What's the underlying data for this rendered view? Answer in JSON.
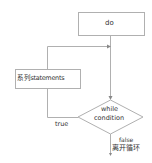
{
  "diagram": {
    "type": "flowchart",
    "nodes": [
      {
        "id": "do",
        "shape": "rect",
        "label": "do"
      },
      {
        "id": "statements",
        "shape": "rect",
        "label": "系列statements"
      },
      {
        "id": "condition",
        "shape": "diamond",
        "label_line1": "while",
        "label_line2": "condition"
      }
    ],
    "edges": [
      {
        "from": "do",
        "to": "condition"
      },
      {
        "from": "condition",
        "to": "statements",
        "label": "true"
      },
      {
        "from": "statements",
        "to": "do"
      },
      {
        "from": "condition",
        "to": "exit",
        "label": "false",
        "sublabel": "离开循环"
      }
    ],
    "colors": {
      "stroke": "#b0b0b0",
      "text": "#333333",
      "background": "#ffffff"
    }
  }
}
